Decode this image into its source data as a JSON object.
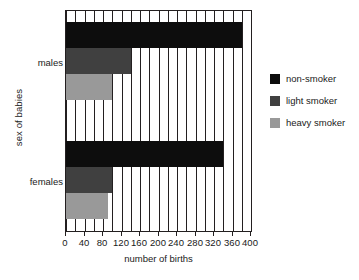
{
  "chart_data": {
    "type": "bar",
    "orientation": "horizontal",
    "title": "",
    "xlabel": "number of births",
    "ylabel": "sex of babies",
    "categories": [
      "males",
      "females"
    ],
    "series": [
      {
        "name": "non-smoker",
        "color": "#0d0d0d",
        "values": [
          380,
          340
        ]
      },
      {
        "name": "light smoker",
        "color": "#404040",
        "values": [
          140,
          100
        ]
      },
      {
        "name": "heavy smoker",
        "color": "#999999",
        "values": [
          100,
          90
        ]
      }
    ],
    "xlim": [
      0,
      400
    ],
    "xticks": [
      0,
      40,
      80,
      120,
      160,
      200,
      240,
      280,
      320,
      360,
      400
    ],
    "xtick_labels": [
      "0",
      "40",
      "80",
      "120",
      "160",
      "200",
      "240",
      "280",
      "320",
      "360",
      "400"
    ],
    "minor_gridline_step": 20,
    "grid": true,
    "legend_position": "right"
  },
  "legend": {
    "items": [
      {
        "label": "non-smoker",
        "color": "#0d0d0d"
      },
      {
        "label": "light smoker",
        "color": "#404040"
      },
      {
        "label": "heavy smoker",
        "color": "#999999"
      }
    ]
  },
  "axes": {
    "x_title": "number of births",
    "y_title": "sex of babies",
    "category_labels": [
      "males",
      "females"
    ]
  }
}
